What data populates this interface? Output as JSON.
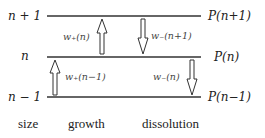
{
  "levels": [
    {
      "size_label": "n + 1",
      "prob_label": "P(n+1)"
    },
    {
      "size_label": "n",
      "prob_label": "P(n)"
    },
    {
      "size_label": "n − 1",
      "prob_label": "P(n−1)"
    }
  ],
  "rates": {
    "growth_upper": "w₊(n)",
    "dissolution_upper": "w₋(n+1)",
    "growth_lower": "w₊(n−1)",
    "dissolution_lower": "w₋(n)"
  },
  "footer": {
    "size": "size",
    "growth": "growth",
    "dissolution": "dissolution"
  },
  "colors": {
    "line": "#333333",
    "text": "#222222"
  }
}
